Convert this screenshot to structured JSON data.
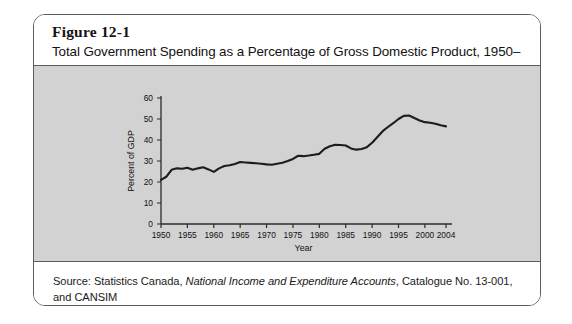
{
  "figure": {
    "number": "Figure 12-1",
    "title": "Total Government Spending as a Percentage of Gross Domestic Product, 1950–2004",
    "source": {
      "prefix": "Source: Statistics Canada, ",
      "italic": "National Income and Expenditure Accounts",
      "suffix": ", Catalogue No. 13-001, and CANSIM",
      "line2": "Tables 380-0017 and 380-0022."
    }
  },
  "colors": {
    "frame_border": "#5c5c5c",
    "plot_background": "#d2d2d2",
    "axis": "#2b2b2b",
    "series_line": "#1c1c1c",
    "page_background": "#ffffff"
  },
  "chart_data": {
    "type": "line",
    "title": "Total Government Spending as a Percentage of Gross Domestic Product, 1950–2004",
    "xlabel": "Year",
    "ylabel": "Percent of GDP",
    "xlim": [
      1950,
      2004
    ],
    "ylim": [
      0,
      60
    ],
    "ytick_values": [
      0,
      10,
      20,
      30,
      40,
      50,
      60
    ],
    "ytick_labels": [
      "0",
      "10",
      "20",
      "30",
      "40",
      "50",
      "60"
    ],
    "xtick_values": [
      1950,
      1955,
      1960,
      1965,
      1970,
      1975,
      1980,
      1985,
      1990,
      1995,
      2000,
      2004
    ],
    "xtick_labels": [
      "1950",
      "1955",
      "1960",
      "1965",
      "1970",
      "1975",
      "1980",
      "1985",
      "1990",
      "1995",
      "2000",
      "2004"
    ],
    "grid": false,
    "legend": null,
    "series": [
      {
        "name": "Total government spending as percent of GDP",
        "x": [
          1950,
          1951,
          1952,
          1953,
          1954,
          1955,
          1956,
          1957,
          1958,
          1959,
          1960,
          1961,
          1962,
          1963,
          1964,
          1965,
          1966,
          1967,
          1968,
          1969,
          1970,
          1971,
          1972,
          1973,
          1974,
          1975,
          1976,
          1977,
          1978,
          1979,
          1980,
          1981,
          1982,
          1983,
          1984,
          1985,
          1986,
          1987,
          1988,
          1989,
          1990,
          1991,
          1992,
          1993,
          1994,
          1995,
          1996,
          1997,
          1998,
          1999,
          2000,
          2001,
          2002,
          2003,
          2004
        ],
        "values": [
          21.0,
          22.5,
          25.8,
          26.5,
          26.3,
          26.8,
          25.8,
          26.5,
          27.0,
          26.0,
          24.8,
          26.5,
          27.6,
          28.0,
          28.6,
          29.5,
          29.3,
          29.1,
          28.9,
          28.7,
          28.4,
          28.2,
          28.7,
          29.2,
          30.0,
          31.0,
          32.5,
          32.3,
          32.6,
          33.0,
          33.4,
          35.8,
          37.0,
          37.7,
          37.6,
          37.4,
          36.0,
          35.4,
          35.7,
          36.6,
          38.7,
          41.4,
          44.2,
          46.2,
          48.0,
          50.0,
          51.5,
          51.7,
          50.5,
          49.3,
          48.5,
          48.2,
          47.7,
          47.0,
          46.5
        ]
      }
    ]
  }
}
